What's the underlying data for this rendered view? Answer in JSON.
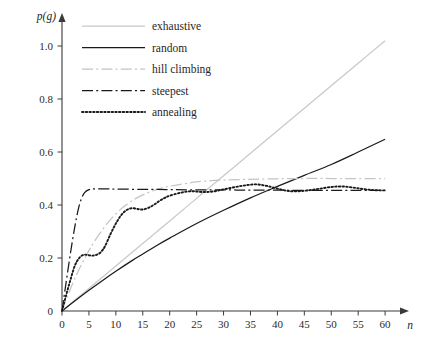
{
  "chart_data": {
    "type": "line",
    "title": "",
    "xlabel": "n",
    "ylabel": "p(g)",
    "xlim": [
      0,
      62
    ],
    "ylim": [
      0,
      1.06
    ],
    "grid": false,
    "legend_position": "top-center",
    "xticks": [
      0,
      5,
      10,
      15,
      20,
      25,
      30,
      35,
      40,
      45,
      50,
      55,
      60
    ],
    "xtick_labels": [
      "0",
      "5",
      "10",
      "15",
      "20",
      "25",
      "30",
      "35",
      "40",
      "45",
      "50",
      "55",
      "60"
    ],
    "yticks": [
      0,
      0.2,
      0.4,
      0.6,
      0.8,
      1.0
    ],
    "ytick_labels": [
      "0",
      "0.2",
      "0.4",
      "0.6",
      "0.8",
      "1.0"
    ],
    "series": [
      {
        "name": "exhaustive",
        "style": "solid",
        "color": "#c9c9c9",
        "x": [
          0,
          5,
          10,
          15,
          20,
          25,
          30,
          35,
          40,
          45,
          50,
          55,
          60
        ],
        "values": [
          0.0,
          0.085,
          0.17,
          0.255,
          0.34,
          0.425,
          0.51,
          0.595,
          0.68,
          0.765,
          0.85,
          0.935,
          1.02
        ]
      },
      {
        "name": "random",
        "style": "solid",
        "color": "#1a1a1a",
        "x": [
          0,
          2,
          5,
          8,
          10,
          13,
          15,
          18,
          20,
          25,
          30,
          35,
          40,
          45,
          50,
          55,
          60
        ],
        "values": [
          0.0,
          0.032,
          0.078,
          0.122,
          0.15,
          0.19,
          0.215,
          0.252,
          0.275,
          0.33,
          0.38,
          0.427,
          0.47,
          0.512,
          0.553,
          0.6,
          0.648
        ]
      },
      {
        "name": "hill climbing",
        "style": "dashdot",
        "color": "#c4c4c4",
        "x": [
          0,
          1,
          2,
          3,
          4,
          5,
          6,
          8,
          10,
          12,
          14,
          16,
          18,
          20,
          25,
          30,
          35,
          40,
          45,
          50,
          55,
          60
        ],
        "values": [
          0.0,
          0.055,
          0.105,
          0.15,
          0.19,
          0.228,
          0.262,
          0.32,
          0.367,
          0.402,
          0.428,
          0.447,
          0.461,
          0.471,
          0.487,
          0.494,
          0.497,
          0.499,
          0.5,
          0.5,
          0.5,
          0.5
        ]
      },
      {
        "name": "steepest",
        "style": "dashdot",
        "color": "#1a1a1a",
        "x": [
          0,
          0.6,
          1.2,
          1.8,
          2.4,
          3,
          3.6,
          4.2,
          5,
          6,
          8,
          10,
          15,
          20,
          25,
          30,
          35,
          40,
          45,
          50,
          55,
          60
        ],
        "values": [
          0.0,
          0.085,
          0.168,
          0.248,
          0.32,
          0.382,
          0.424,
          0.447,
          0.458,
          0.461,
          0.461,
          0.46,
          0.459,
          0.458,
          0.457,
          0.457,
          0.456,
          0.456,
          0.455,
          0.455,
          0.455,
          0.455
        ]
      },
      {
        "name": "annealing",
        "style": "dotted",
        "color": "#1a1a1a",
        "x": [
          0,
          0.8,
          1.6,
          2.4,
          3.2,
          4,
          4.8,
          5.6,
          6.4,
          7.2,
          8,
          9,
          10,
          11,
          12,
          13,
          14,
          15,
          16,
          17,
          18,
          19,
          20,
          22,
          24,
          26,
          28,
          30,
          32,
          34,
          36,
          38,
          40,
          42,
          44,
          46,
          48,
          50,
          52,
          54,
          56,
          58,
          60
        ],
        "values": [
          0.0,
          0.062,
          0.12,
          0.172,
          0.2,
          0.212,
          0.211,
          0.209,
          0.212,
          0.222,
          0.245,
          0.29,
          0.33,
          0.362,
          0.381,
          0.388,
          0.385,
          0.383,
          0.389,
          0.4,
          0.414,
          0.426,
          0.435,
          0.446,
          0.452,
          0.449,
          0.451,
          0.459,
          0.467,
          0.474,
          0.478,
          0.472,
          0.462,
          0.453,
          0.452,
          0.456,
          0.462,
          0.468,
          0.47,
          0.466,
          0.46,
          0.456,
          0.455
        ]
      }
    ]
  },
  "legend": {
    "items": [
      {
        "label": "exhaustive"
      },
      {
        "label": "random"
      },
      {
        "label": "hill climbing"
      },
      {
        "label": "steepest"
      },
      {
        "label": "annealing"
      }
    ]
  }
}
